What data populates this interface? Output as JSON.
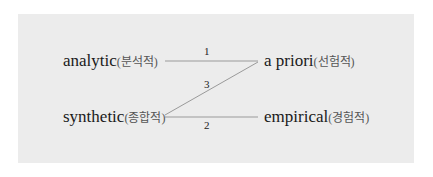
{
  "left_terms": [
    {
      "en": "analytic",
      "ko": "(분석적)"
    },
    {
      "en": "synthetic",
      "ko": "(종합적)"
    }
  ],
  "right_terms": [
    {
      "en": "a priori",
      "ko": "(선험적)"
    },
    {
      "en": "empirical",
      "ko": "(경험적)"
    }
  ],
  "connections": [
    {
      "label": "1",
      "from": "analytic",
      "to": "a priori"
    },
    {
      "label": "3",
      "from": "synthetic",
      "to": "a priori"
    },
    {
      "label": "2",
      "from": "synthetic",
      "to": "empirical"
    }
  ],
  "colors": {
    "panel": "#ececec",
    "line": "#999999"
  }
}
